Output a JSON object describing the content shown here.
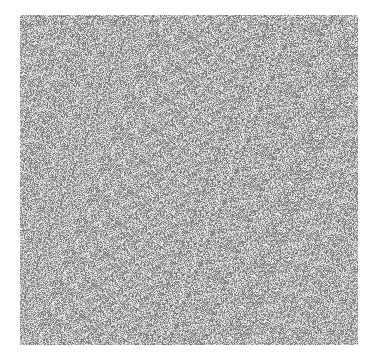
{
  "image": {
    "description": "grayscale noise texture",
    "background": "#ffffff",
    "noise_region": {
      "x": 20,
      "y": 15,
      "width": 338,
      "height": 330
    },
    "tone_range": {
      "dark": "#6e6e6e",
      "light": "#f2f2f2"
    }
  }
}
